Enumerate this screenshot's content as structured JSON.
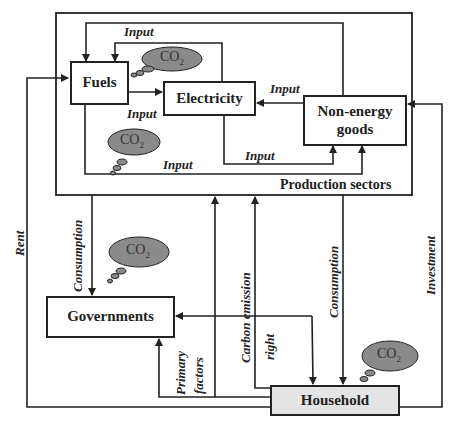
{
  "diagram": {
    "nodes": {
      "fuels": "Fuels",
      "electricity": "Electricity",
      "non_energy_line1": "Non-energy",
      "non_energy_line2": "goods",
      "governments": "Governments",
      "household": "Household"
    },
    "container": {
      "production_label": "Production sectors"
    },
    "edge_labels": {
      "input_top": "Input",
      "input_fuels_elec": "Input",
      "input_nonenergy_elec": "Input",
      "input_elec_nonenergy": "Input",
      "input_fuels_nonenergy": "Input",
      "rent": "Rent",
      "consumption_gov": "Consumption",
      "primary_factors_1": "Primary",
      "primary_factors_2": "factors",
      "carbon_emission_1": "Carbon emission",
      "carbon_emission_2": "right",
      "consumption_household": "Consumption",
      "investment": "Investment"
    },
    "emissions": {
      "co2_text": "CO",
      "co2_sub": "2"
    },
    "colors": {
      "line": "#222222",
      "cloud_fill": "#8a8a8a",
      "household_fill": "#e4e4e4"
    }
  }
}
